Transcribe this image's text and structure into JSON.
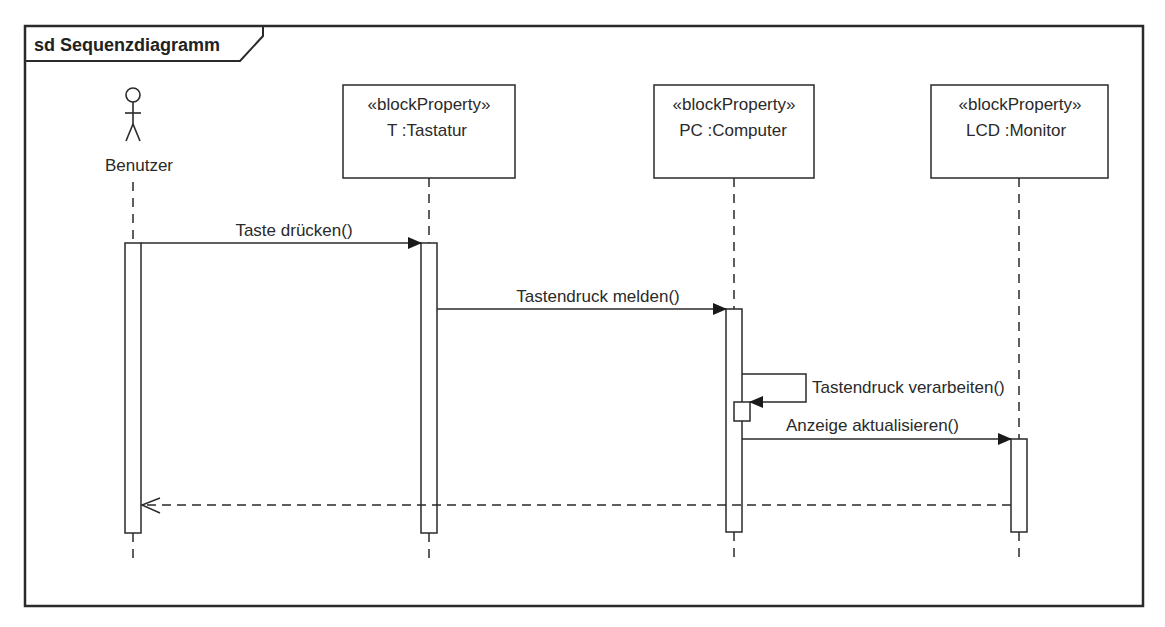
{
  "frame": {
    "title": "sd Sequenzdiagramm"
  },
  "actor": {
    "name": "Benutzer"
  },
  "lifelines": [
    {
      "stereotype": "«blockProperty»",
      "name": "T :Tastatur"
    },
    {
      "stereotype": "«blockProperty»",
      "name": "PC :Computer"
    },
    {
      "stereotype": "«blockProperty»",
      "name": "LCD :Monitor"
    }
  ],
  "messages": [
    {
      "label": "Taste drücken()",
      "from": "Benutzer",
      "to": "T :Tastatur",
      "type": "synchronous"
    },
    {
      "label": "Tastendruck melden()",
      "from": "T :Tastatur",
      "to": "PC :Computer",
      "type": "synchronous"
    },
    {
      "label": "Tastendruck verarbeiten()",
      "from": "PC :Computer",
      "to": "PC :Computer",
      "type": "self"
    },
    {
      "label": "Anzeige aktualisieren()",
      "from": "PC :Computer",
      "to": "LCD :Monitor",
      "type": "synchronous"
    },
    {
      "label": "",
      "from": "LCD :Monitor",
      "to": "Benutzer",
      "type": "return"
    }
  ],
  "colors": {
    "line": "#2a2a2a",
    "background": "#ffffff"
  }
}
